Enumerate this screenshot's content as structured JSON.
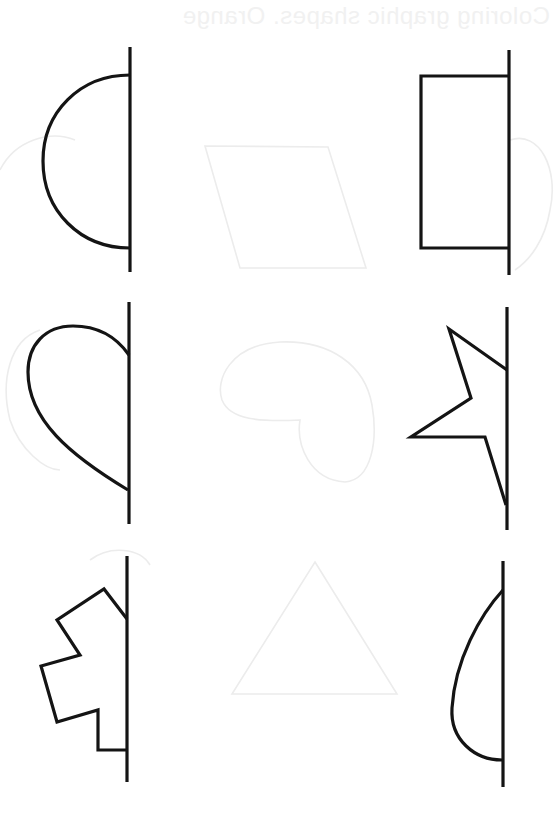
{
  "worksheet": {
    "ghost_title": "Coloring graphic shapes. Orange",
    "ink_color": "#141414",
    "ghost_color": "#ececec",
    "background": "#ffffff",
    "task": "Symmetry drawing - complete the other half of each shape",
    "shapes": [
      {
        "id": "half-circle",
        "row": 1,
        "column": "left",
        "axis_x": 130,
        "axis_y": [
          47,
          272
        ]
      },
      {
        "id": "half-rectangle",
        "row": 1,
        "column": "right",
        "axis_x": 509,
        "axis_y": [
          50,
          275
        ]
      },
      {
        "id": "half-heart",
        "row": 2,
        "column": "left",
        "axis_x": 129,
        "axis_y": [
          302,
          524
        ]
      },
      {
        "id": "half-star",
        "row": 2,
        "column": "right",
        "axis_x": 507,
        "axis_y": [
          307,
          530
        ]
      },
      {
        "id": "half-gear",
        "row": 3,
        "column": "left",
        "axis_x": 127,
        "axis_y": [
          556,
          782
        ]
      },
      {
        "id": "half-teardrop",
        "row": 3,
        "column": "right",
        "axis_x": 503,
        "axis_y": [
          561,
          787
        ]
      }
    ],
    "ghost_shapes": [
      "trapezoid",
      "round-blob",
      "triangle",
      "cloud-left",
      "cloud-right"
    ]
  }
}
